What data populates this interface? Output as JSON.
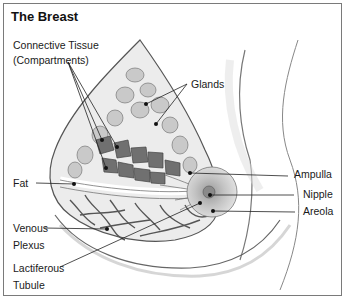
{
  "diagram": {
    "title": "The Breast",
    "labels": {
      "connective_tissue_line1": "Connective Tissue",
      "connective_tissue_line2": "(Compartments)",
      "glands": "Glands",
      "fat": "Fat",
      "venous_line1": "Venous",
      "venous_line2": "Plexus",
      "lactiferous_line1": "Lactiferous",
      "lactiferous_line2": "Tubule",
      "ampulla": "Ampulla",
      "nipple": "Nipple",
      "areola": "Areola"
    },
    "colors": {
      "outline": "#555555",
      "tissue_fill": "#d9d9d9",
      "gland_fill": "#bfbfbf",
      "dark_compartment": "#6e6e6e",
      "areola_fill": "#cfcfcf",
      "leader_line": "#222222"
    }
  }
}
